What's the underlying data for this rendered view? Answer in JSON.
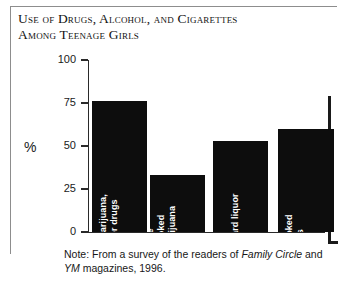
{
  "figure": {
    "title_lines": [
      "Use of Drugs, Alcohol, and Cigarettes",
      "Among Teenage Girls"
    ],
    "axis_title": "%",
    "note_prefix": "Note: From a survey of the readers of ",
    "note_italic1": "Family Circle",
    "note_middle": " and ",
    "note_italic2": "YM",
    "note_suffix": " magazines, 1996.",
    "bar_color": "#0d0d0d",
    "label_color": "#ffffff",
    "axis_color": "#2a2a2a"
  },
  "chart_data": {
    "type": "bar",
    "title": "Use of Drugs, Alcohol, and Cigarettes Among Teenage Girls",
    "xlabel": "",
    "ylabel": "%",
    "ylim": [
      0,
      100
    ],
    "yticks": [
      0,
      25,
      50,
      75,
      100
    ],
    "ytick_labels": [
      "0",
      "25",
      "50",
      "75",
      "100"
    ],
    "grid": false,
    "legend": "none",
    "categories": [
      "have tried marijuana, beer, or other drugs",
      "have smoked marijuana",
      "drink hard liquor",
      "have smoked cigarettes"
    ],
    "values": [
      76,
      33,
      53,
      60
    ],
    "bars": [
      {
        "value": 76,
        "value_label": "76%",
        "label_lines": [
          "76%",
          "have tried marijuana,",
          "beer, or other drugs"
        ]
      },
      {
        "value": 33,
        "value_label": "Almost 33%",
        "label_lines": [
          "Almost 33%",
          "have",
          "smoked",
          "marijuana"
        ]
      },
      {
        "value": 53,
        "value_label": "53%",
        "label_lines": [
          "53%",
          "drink hard liquor"
        ]
      },
      {
        "value": 60,
        "value_label": "60%",
        "label_lines": [
          "60%",
          "have smoked",
          "cigarettes"
        ]
      }
    ],
    "annotation": "Note: From a survey of the readers of Family Circle and YM magazines, 1996."
  }
}
